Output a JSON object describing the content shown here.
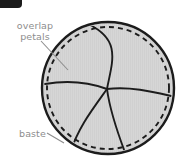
{
  "figure": {
    "name": "circular-petal-overlap-sewing-diagram",
    "background_color": "#ffffff",
    "width": 185,
    "height": 167
  },
  "corner_badge": {
    "color": "#1b1b1b",
    "label": ""
  },
  "labels": {
    "overlap_petals": "overlap\npetals",
    "baste": "baste"
  },
  "colors": {
    "fill": "#d6d6d6",
    "outline": "#1c1c1c",
    "dashed_line": "#1c1c1c",
    "petal_line": "#1c1c1c",
    "text": "#8d8d8d",
    "leader": "#8d8d8d"
  },
  "shape": {
    "type": "circle",
    "center_x": 108,
    "center_y": 88,
    "outer_radius": 66,
    "baste_radius": 61,
    "petal_count": 5,
    "convergence_x": 107,
    "convergence_y": 89,
    "outer_stroke_width": 2.4,
    "baste_dash_pattern": "5 4"
  },
  "leaders": [
    {
      "name": "overlap-petals-leader",
      "from_x": 41,
      "from_y": 41,
      "to_x": 68,
      "to_y": 70
    },
    {
      "name": "baste-leader",
      "from_x": 47,
      "from_y": 133,
      "to_x": 64,
      "to_y": 143
    }
  ]
}
